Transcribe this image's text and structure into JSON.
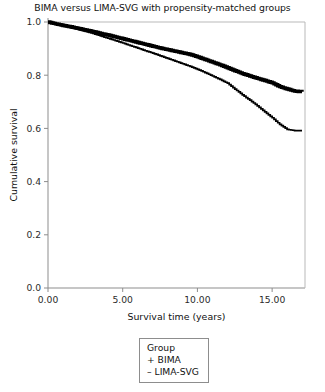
{
  "chart_data": {
    "type": "line",
    "title": "BIMA versus LIMA-SVG with propensity-matched groups",
    "xlabel": "Survival time (years)",
    "ylabel": "Cumulative survival",
    "xlim": [
      0,
      17.2
    ],
    "ylim": [
      0.0,
      1.0
    ],
    "grid": false,
    "legend_position": "below-plot",
    "legend_title": "Group",
    "xticks": [
      0,
      5,
      10,
      15
    ],
    "xtick_labels": [
      "0.00",
      "5.00",
      "10.00",
      "15.00"
    ],
    "yticks": [
      0.0,
      0.2,
      0.4,
      0.6,
      0.8,
      1.0
    ],
    "ytick_labels": [
      "0.0",
      "0.2",
      "0.4",
      "0.6",
      "0.8",
      "1.0"
    ],
    "series": [
      {
        "name": "BIMA",
        "legend_label": "+ BIMA",
        "marker": "+",
        "line_weight": "thick",
        "final_value": 0.74,
        "x": [
          0,
          0.5,
          1.0,
          1.5,
          2.0,
          2.5,
          3.0,
          3.5,
          4.0,
          4.5,
          5.0,
          5.5,
          6.0,
          6.5,
          7.0,
          7.5,
          8.0,
          8.5,
          9.0,
          9.5,
          10.0,
          10.5,
          11.0,
          11.5,
          12.0,
          12.5,
          13.0,
          13.5,
          14.0,
          14.5,
          15.0,
          15.5,
          16.0,
          16.5,
          17.0
        ],
        "y": [
          1.0,
          0.993,
          0.987,
          0.982,
          0.976,
          0.97,
          0.964,
          0.957,
          0.951,
          0.944,
          0.937,
          0.93,
          0.923,
          0.916,
          0.909,
          0.902,
          0.896,
          0.89,
          0.884,
          0.878,
          0.869,
          0.859,
          0.849,
          0.839,
          0.828,
          0.817,
          0.806,
          0.797,
          0.788,
          0.78,
          0.771,
          0.757,
          0.748,
          0.74,
          0.738
        ]
      },
      {
        "name": "LIMA-SVG",
        "legend_label": "– LIMA-SVG",
        "marker": "–",
        "line_weight": "thin",
        "final_value": 0.59,
        "x": [
          0,
          0.5,
          1.0,
          1.5,
          2.0,
          2.5,
          3.0,
          3.5,
          4.0,
          4.5,
          5.0,
          5.5,
          6.0,
          6.5,
          7.0,
          7.5,
          8.0,
          8.5,
          9.0,
          9.5,
          10.0,
          10.5,
          11.0,
          11.5,
          12.0,
          12.5,
          13.0,
          13.5,
          14.0,
          14.5,
          15.0,
          15.5,
          16.0,
          16.5,
          17.0
        ],
        "y": [
          1.0,
          0.992,
          0.985,
          0.979,
          0.972,
          0.965,
          0.957,
          0.948,
          0.939,
          0.93,
          0.921,
          0.911,
          0.902,
          0.892,
          0.883,
          0.873,
          0.863,
          0.853,
          0.843,
          0.833,
          0.822,
          0.81,
          0.797,
          0.784,
          0.77,
          0.748,
          0.726,
          0.706,
          0.685,
          0.662,
          0.64,
          0.615,
          0.596,
          0.592,
          0.592
        ]
      }
    ]
  },
  "legend": {
    "title": "Group",
    "items": [
      {
        "label": "+ BIMA"
      },
      {
        "label": "– LIMA-SVG"
      }
    ]
  }
}
